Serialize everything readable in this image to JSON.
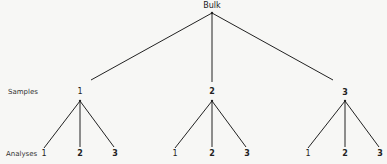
{
  "root": {
    "label": "Bulk"
  },
  "row_labels": {
    "samples": "Samples",
    "analyses": "Analyses"
  },
  "samples": [
    {
      "label": "1",
      "analyses": [
        "1",
        "2",
        "3"
      ]
    },
    {
      "label": "2",
      "analyses": [
        "1",
        "2",
        "3"
      ]
    },
    {
      "label": "3",
      "analyses": [
        "1",
        "2",
        "3"
      ]
    }
  ],
  "colors": {
    "line": "#222222",
    "background": "#f7f7f5"
  }
}
